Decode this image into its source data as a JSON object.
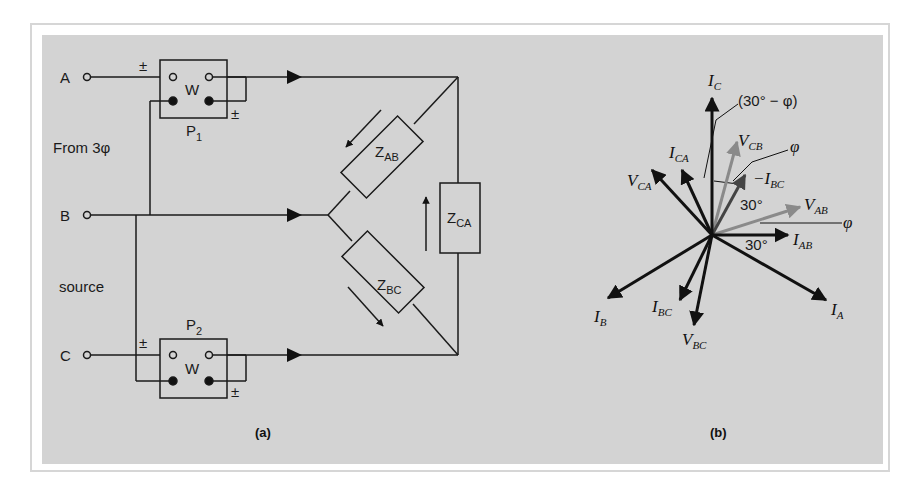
{
  "figure": {
    "panel_a": {
      "caption": "(a)",
      "source_label_line1": "From 3φ",
      "source_label_line2": "source",
      "terminals": [
        {
          "label": "A"
        },
        {
          "label": "B"
        },
        {
          "label": "C"
        }
      ],
      "wattmeters": [
        {
          "name": "P",
          "sub": "1",
          "symbol": "W",
          "polarity": "±"
        },
        {
          "name": "P",
          "sub": "2",
          "symbol": "W",
          "polarity": "±"
        }
      ],
      "impedances": [
        {
          "main": "Z",
          "sub": "AB"
        },
        {
          "main": "Z",
          "sub": "BC"
        },
        {
          "main": "Z",
          "sub": "CA"
        }
      ]
    },
    "panel_b": {
      "caption": "(b)",
      "phasors": [
        {
          "main": "I",
          "sub": "C",
          "color": "#111111"
        },
        {
          "main": "V",
          "sub": "CB",
          "color": "#8a8a8a"
        },
        {
          "main": "I",
          "sub": "CA",
          "color": "#111111"
        },
        {
          "main": "V",
          "sub": "CA",
          "color": "#111111"
        },
        {
          "main": "−I",
          "sub": "BC",
          "color": "#444444"
        },
        {
          "main": "V",
          "sub": "AB",
          "color": "#8a8a8a"
        },
        {
          "main": "I",
          "sub": "AB",
          "color": "#111111"
        },
        {
          "main": "I",
          "sub": "A",
          "color": "#111111"
        },
        {
          "main": "I",
          "sub": "B",
          "color": "#111111"
        },
        {
          "main": "I",
          "sub": "BC",
          "color": "#111111"
        },
        {
          "main": "V",
          "sub": "BC",
          "color": "#111111"
        }
      ],
      "angles": {
        "a30_minus_phi": "(30° − φ)",
        "phi_upper": "φ",
        "phi_right": "φ",
        "a30_upper": "30°",
        "a30_lower": "30°"
      }
    }
  }
}
